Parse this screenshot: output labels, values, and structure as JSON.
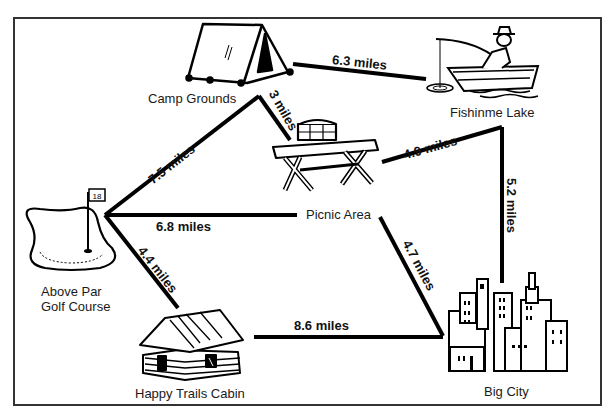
{
  "map": {
    "frame_color": "#333333",
    "route_color": "#000000",
    "locations": [
      {
        "id": "camp",
        "label": "Camp Grounds",
        "icon": "tent-icon"
      },
      {
        "id": "lake",
        "label": "Fishinme Lake",
        "icon": "fishing-boat-icon"
      },
      {
        "id": "picnic",
        "label": "Picnic Area",
        "icon": "picnic-table-icon"
      },
      {
        "id": "golf",
        "label_line1": "Above Par",
        "label_line2": "Golf Course",
        "icon": "golf-flag-icon",
        "flag_number": "18"
      },
      {
        "id": "cabin",
        "label": "Happy Trails Cabin",
        "icon": "log-cabin-icon"
      },
      {
        "id": "city",
        "label": "Big City",
        "icon": "city-skyline-icon"
      }
    ],
    "routes": [
      {
        "from": "Camp Grounds",
        "to": "Fishinme Lake",
        "label": "6.3 miles"
      },
      {
        "from": "Camp Grounds",
        "to": "Picnic Area",
        "label": "3 miles"
      },
      {
        "from": "Above Par Golf Course",
        "to": "Camp Grounds",
        "label": "7.5 miles"
      },
      {
        "from": "Picnic Area",
        "to": "Fishinme Lake",
        "label": "4.9 miles"
      },
      {
        "from": "Fishinme Lake",
        "to": "Big City",
        "label": "5.2 miles"
      },
      {
        "from": "Above Par Golf Course",
        "to": "Picnic Area",
        "label": "6.8 miles"
      },
      {
        "from": "Picnic Area",
        "to": "Big City",
        "label": "4.7 miles"
      },
      {
        "from": "Above Par Golf Course",
        "to": "Happy Trails Cabin",
        "label": "4.4 miles"
      },
      {
        "from": "Happy Trails Cabin",
        "to": "Big City",
        "label": "8.6 miles"
      }
    ]
  }
}
